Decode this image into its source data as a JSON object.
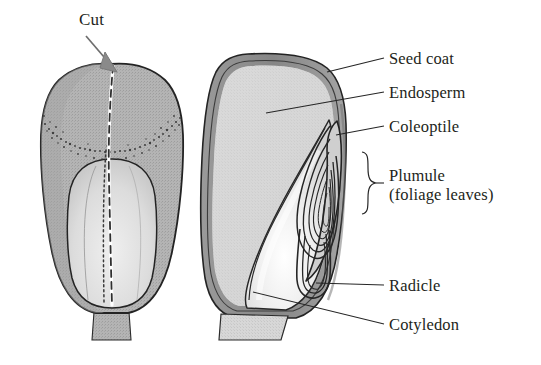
{
  "figure": {
    "background_color": "#ffffff",
    "ink_color": "#231f20",
    "line_color": "#3a3a3a"
  },
  "colors": {
    "seed_coat_band": "#8c8c8c",
    "whole_seed_fill": "#b0b0b0",
    "whole_seed_embryo_fill": "#d8d8d8",
    "endosperm_fill": "#d6d6d6",
    "cotyledon_fill": "#e8e8e8",
    "outline": "#2b2b2b",
    "stipple": "#4a4a4a"
  },
  "callout": {
    "cut": {
      "label": "Cut",
      "target": "top of whole grain, midline",
      "arrow": "diagonal-down-right"
    }
  },
  "labels": [
    {
      "id": "seed-coat",
      "text": "Seed coat",
      "sub": "",
      "leader": "line",
      "x": 389,
      "y": 49
    },
    {
      "id": "endosperm",
      "text": "Endosperm",
      "sub": "",
      "leader": "line",
      "x": 389,
      "y": 83
    },
    {
      "id": "coleoptile",
      "text": "Coleoptile",
      "sub": "",
      "leader": "line",
      "x": 389,
      "y": 117
    },
    {
      "id": "plumule",
      "text": "Plumule",
      "sub": "(foliage leaves)",
      "leader": "brace",
      "x": 389,
      "y": 166
    },
    {
      "id": "radicle",
      "text": "Radicle",
      "sub": "",
      "leader": "line",
      "x": 389,
      "y": 276
    },
    {
      "id": "cotyledon",
      "text": "Cotyledon",
      "sub": "",
      "leader": "line",
      "x": 389,
      "y": 315
    }
  ],
  "diagram": {
    "left_seed": {
      "name": "whole grain, external view",
      "features": [
        "seed coat surface",
        "stippled boundary band",
        "embryo outline (oval)",
        "dashed cut line along midline",
        "stalk at base"
      ]
    },
    "right_seed": {
      "name": "longitudinal section",
      "features": [
        "seed coat",
        "endosperm",
        "coleoptile",
        "plumule (rolled foliage leaves)",
        "radicle",
        "cotyledon (scutellum)"
      ]
    }
  }
}
